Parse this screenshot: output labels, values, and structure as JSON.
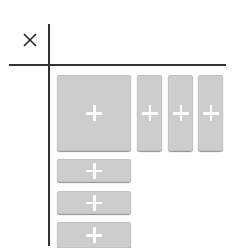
{
  "close_icon": "close-icon",
  "colors": {
    "tile": "#cdcdcd",
    "plus": "#ffffff",
    "lines": "#333333"
  },
  "grid": {
    "large_tile": {
      "icon": "plus-icon"
    },
    "column_tiles": [
      {
        "icon": "plus-icon"
      },
      {
        "icon": "plus-icon"
      },
      {
        "icon": "plus-icon"
      }
    ],
    "row_tiles": [
      {
        "icon": "plus-icon"
      },
      {
        "icon": "plus-icon"
      },
      {
        "icon": "plus-icon"
      }
    ]
  }
}
